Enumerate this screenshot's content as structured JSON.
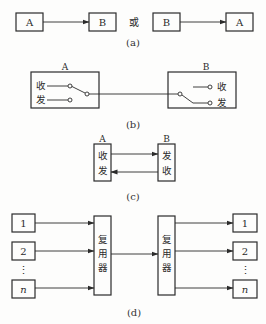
{
  "panel_a": {
    "caption": "(a)",
    "connector_word": "或",
    "left_pair": {
      "from": "A",
      "to": "B"
    },
    "right_pair": {
      "from": "B",
      "to": "A"
    }
  },
  "panel_b": {
    "caption": "(b)",
    "station_a": {
      "title": "A",
      "receive": "收",
      "send": "发"
    },
    "station_b": {
      "title": "B",
      "receive": "收",
      "send": "发"
    }
  },
  "panel_c": {
    "caption": "(c)",
    "station_a": {
      "title": "A",
      "line1": "收",
      "line2": "发"
    },
    "station_b": {
      "title": "B",
      "line1": "发",
      "line2": "收"
    }
  },
  "panel_d": {
    "caption": "(d)",
    "inputs": [
      "1",
      "2",
      "n"
    ],
    "outputs": [
      "1",
      "2",
      "n"
    ],
    "ellipsis": "⋮",
    "mux_left": {
      "c1": "复",
      "c2": "用",
      "c3": "器"
    },
    "mux_right": {
      "c1": "复",
      "c2": "用",
      "c3": "器"
    }
  },
  "colors": {
    "ink": "#2b2b2b",
    "background": "#fdfdfc"
  }
}
